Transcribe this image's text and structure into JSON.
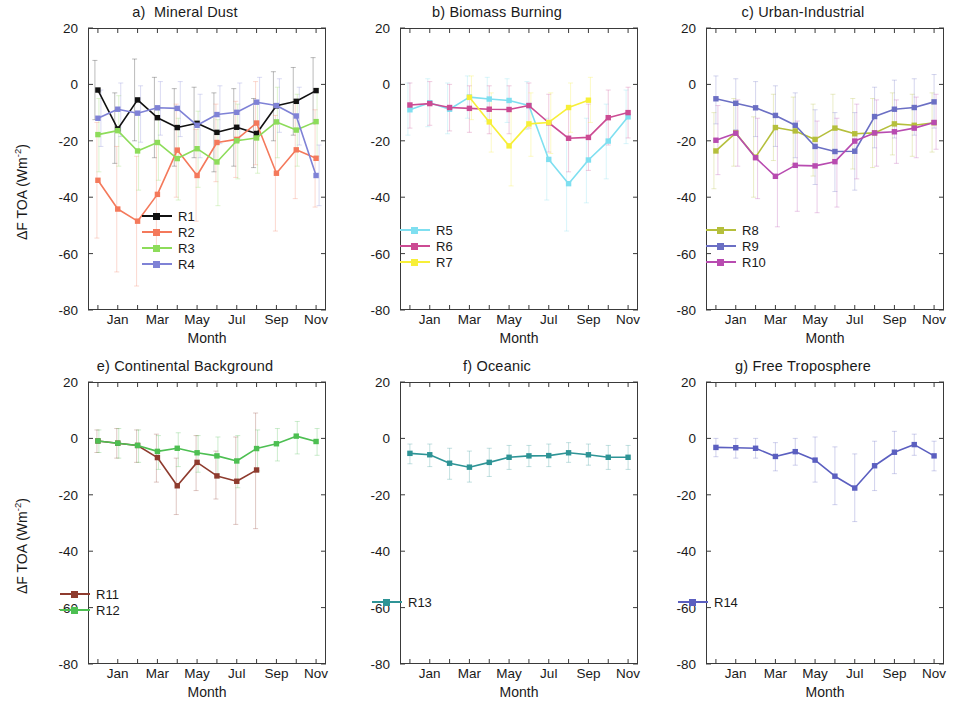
{
  "figure": {
    "axis_y_title_html": "ΔF TOA (Wm<sup>-2</sup>)",
    "axis_x_title": "Month",
    "y_ticks": [
      "20",
      "0",
      "-20",
      "-40",
      "-60",
      "-80"
    ],
    "x_ticks": [
      "Jan",
      "Mar",
      "May",
      "Jul",
      "Sep",
      "Nov"
    ]
  },
  "chart_data": [
    {
      "type": "line",
      "panel_id": "a",
      "title": "a)  Mineral Dust",
      "xlabel": "Month",
      "ylabel": "ΔF TOA (Wm-2)",
      "ylim": [
        -80,
        20
      ],
      "yticks": [
        20,
        0,
        -20,
        -40,
        -60,
        -80
      ],
      "x": [
        "Dec",
        "Jan",
        "Feb",
        "Mar",
        "Apr",
        "May",
        "Jun",
        "Jul",
        "Aug",
        "Sep",
        "Oct",
        "Nov"
      ],
      "xtick_labels": [
        "Jan",
        "Mar",
        "May",
        "Jul",
        "Sep",
        "Nov"
      ],
      "grid": false,
      "legend_position": "lower-center",
      "errorbars": true,
      "series": [
        {
          "name": "R1",
          "color": "#111111",
          "values": [
            -2.0,
            -15.8,
            -5.5,
            -11.8,
            -15.3,
            -13.8,
            -17.0,
            -15.2,
            -17.4,
            -7.6,
            -6.0,
            -2.2
          ],
          "err_low": [
            -12.5,
            -28.0,
            -20.0,
            -26.0,
            -29.0,
            -26.0,
            -31.0,
            -29.0,
            -29.5,
            -20.0,
            -18.0,
            -14.0
          ],
          "err_high": [
            8.5,
            -3.0,
            9.0,
            2.5,
            -1.5,
            -1.0,
            -3.0,
            -1.5,
            -5.0,
            4.5,
            6.0,
            9.5
          ]
        },
        {
          "name": "R2",
          "color": "#f4795b",
          "values": [
            -34.0,
            -44.2,
            -48.5,
            -39.0,
            -23.3,
            -32.3,
            -20.6,
            -19.5,
            -13.7,
            -31.5,
            -23.2,
            -26.2
          ],
          "err_low": [
            -54.5,
            -66.5,
            -71.5,
            -58.0,
            -40.0,
            -48.5,
            -34.5,
            -33.0,
            -28.5,
            -52.0,
            -40.5,
            -43.5
          ],
          "err_high": [
            -13.5,
            -22.0,
            -25.5,
            -20.0,
            -7.0,
            -16.0,
            -7.0,
            -6.0,
            1.0,
            -11.0,
            -6.0,
            -9.0
          ]
        },
        {
          "name": "R3",
          "color": "#8ddc5a",
          "values": [
            -17.8,
            -16.4,
            -23.6,
            -20.6,
            -26.3,
            -22.8,
            -27.5,
            -20.0,
            -19.0,
            -13.3,
            -16.2,
            -13.2
          ],
          "err_low": [
            -31.0,
            -29.0,
            -37.5,
            -34.0,
            -41.0,
            -36.5,
            -43.0,
            -33.5,
            -31.5,
            -26.0,
            -29.0,
            -25.5
          ],
          "err_high": [
            -5.0,
            -4.0,
            -10.0,
            -8.0,
            -12.0,
            -9.5,
            -12.5,
            -7.0,
            -6.5,
            -1.0,
            -3.5,
            -1.5
          ]
        },
        {
          "name": "R4",
          "color": "#7f82d6",
          "values": [
            -12.0,
            -8.8,
            -10.2,
            -8.3,
            -8.5,
            -14.5,
            -10.7,
            -9.9,
            -6.3,
            -7.5,
            -11.2,
            -32.3
          ],
          "err_low": [
            -22.0,
            -18.5,
            -20.5,
            -18.0,
            -18.5,
            -26.0,
            -21.0,
            -19.5,
            -15.5,
            -17.0,
            -21.5,
            -43.0
          ],
          "err_high": [
            -2.0,
            0.5,
            -0.5,
            1.0,
            1.0,
            -3.5,
            -0.5,
            0.5,
            2.5,
            2.0,
            -1.0,
            -21.5
          ]
        }
      ]
    },
    {
      "type": "line",
      "panel_id": "b",
      "title": "b) Biomass Burning",
      "xlabel": "Month",
      "ylabel": "ΔF TOA (Wm-2)",
      "ylim": [
        -80,
        20
      ],
      "yticks": [
        20,
        0,
        -20,
        -40,
        -60,
        -80
      ],
      "x": [
        "Dec",
        "Jan",
        "Feb",
        "Mar",
        "Apr",
        "May",
        "Jun",
        "Jul",
        "Aug",
        "Sep",
        "Oct",
        "Nov"
      ],
      "xtick_labels": [
        "Jan",
        "Mar",
        "May",
        "Jul",
        "Sep",
        "Nov"
      ],
      "grid": false,
      "legend_position": "lower-left",
      "errorbars": true,
      "series": [
        {
          "name": "R5",
          "color": "#7fdff0",
          "values": [
            -9.0,
            -6.5,
            -8.8,
            -4.5,
            -5.2,
            -5.7,
            -7.5,
            -26.6,
            -35.2,
            -26.8,
            -20.1,
            -11.5
          ],
          "err_low": [
            -18.0,
            -15.0,
            -17.5,
            -12.0,
            -13.0,
            -13.5,
            -16.0,
            -41.0,
            -52.0,
            -42.0,
            -33.5,
            -21.0
          ],
          "err_high": [
            0.5,
            2.0,
            0.5,
            3.0,
            2.5,
            2.0,
            1.0,
            -12.0,
            -18.5,
            -12.0,
            -7.0,
            -2.0
          ]
        },
        {
          "name": "R6",
          "color": "#cc4b93",
          "values": [
            -7.3,
            -6.8,
            -8.2,
            -8.5,
            -8.8,
            -8.9,
            -7.5,
            -13.6,
            -19.1,
            -18.8,
            -11.8,
            -10.0
          ],
          "err_low": [
            -15.5,
            -14.5,
            -16.5,
            -17.0,
            -17.5,
            -17.5,
            -15.5,
            -24.0,
            -31.0,
            -30.5,
            -21.5,
            -19.0
          ],
          "err_high": [
            0.5,
            1.0,
            0.0,
            -0.5,
            -0.5,
            -0.5,
            0.5,
            -3.5,
            -7.5,
            -7.0,
            -2.0,
            -1.0
          ]
        },
        {
          "name": "R7",
          "color": "#f7ef38",
          "values": [
            null,
            null,
            null,
            -4.6,
            -13.3,
            -21.8,
            -14.0,
            -13.5,
            -8.2,
            -5.6,
            null,
            null
          ],
          "err_low": [
            null,
            null,
            null,
            -12.5,
            -24.0,
            -36.0,
            -25.5,
            -24.5,
            -17.0,
            -13.5,
            null,
            null
          ],
          "err_high": [
            null,
            null,
            null,
            3.0,
            -3.0,
            -8.5,
            -3.0,
            -3.0,
            0.5,
            2.5,
            null,
            null
          ]
        }
      ]
    },
    {
      "type": "line",
      "panel_id": "c",
      "title": "c) Urban-Industrial",
      "xlabel": "Month",
      "ylabel": "ΔF TOA (Wm-2)",
      "ylim": [
        -80,
        20
      ],
      "yticks": [
        20,
        0,
        -20,
        -40,
        -60,
        -80
      ],
      "x": [
        "Dec",
        "Jan",
        "Feb",
        "Mar",
        "Apr",
        "May",
        "Jun",
        "Jul",
        "Aug",
        "Sep",
        "Oct",
        "Nov"
      ],
      "xtick_labels": [
        "Jan",
        "Mar",
        "May",
        "Jul",
        "Sep",
        "Nov"
      ],
      "grid": false,
      "legend_position": "lower-left",
      "errorbars": true,
      "series": [
        {
          "name": "R8",
          "color": "#b5bf3c",
          "values": [
            -23.6,
            -17.2,
            -25.8,
            -15.3,
            -16.5,
            -19.5,
            -15.5,
            -17.5,
            -17.2,
            -14.0,
            -14.5,
            -13.6
          ],
          "err_low": [
            -37.0,
            -29.0,
            -40.0,
            -27.0,
            -28.5,
            -32.5,
            -27.5,
            -30.0,
            -29.5,
            -25.0,
            -25.5,
            -24.0
          ],
          "err_high": [
            -10.0,
            -5.0,
            -11.5,
            -3.5,
            -4.5,
            -7.0,
            -3.5,
            -5.0,
            -5.0,
            -3.0,
            -3.5,
            -3.0
          ]
        },
        {
          "name": "R9",
          "color": "#6b6fc4",
          "values": [
            -5.1,
            -6.7,
            -8.3,
            -11.0,
            -14.5,
            -22.0,
            -23.8,
            -23.7,
            -11.4,
            -8.8,
            -8.2,
            -6.2
          ],
          "err_low": [
            -14.0,
            -16.0,
            -18.5,
            -22.0,
            -26.0,
            -35.5,
            -38.0,
            -37.5,
            -22.5,
            -19.0,
            -18.0,
            -15.5
          ],
          "err_high": [
            3.0,
            2.0,
            1.0,
            -0.5,
            -3.0,
            -9.0,
            -10.0,
            -10.0,
            -1.0,
            1.5,
            2.0,
            3.5
          ]
        },
        {
          "name": "R10",
          "color": "#b84bb0",
          "values": [
            -19.8,
            -17.3,
            -26.0,
            -32.6,
            -28.7,
            -28.9,
            -27.4,
            -20.1,
            -17.2,
            -16.8,
            -15.5,
            -13.5
          ],
          "err_low": [
            -32.0,
            -29.0,
            -40.5,
            -50.5,
            -45.0,
            -45.5,
            -43.5,
            -33.5,
            -29.0,
            -28.0,
            -26.0,
            -23.0
          ],
          "err_high": [
            -7.5,
            -5.5,
            -12.0,
            -15.5,
            -13.0,
            -13.0,
            -12.0,
            -7.0,
            -5.5,
            -5.5,
            -4.5,
            -3.5
          ]
        }
      ]
    },
    {
      "type": "line",
      "panel_id": "e",
      "title": "e) Continental Background",
      "xlabel": "Month",
      "ylabel": "ΔF TOA (Wm-2)",
      "ylim": [
        -80,
        20
      ],
      "yticks": [
        20,
        0,
        -20,
        -40,
        -60,
        -80
      ],
      "x": [
        "Dec",
        "Jan",
        "Feb",
        "Mar",
        "Apr",
        "May",
        "Jun",
        "Jul",
        "Aug",
        "Sep",
        "Oct",
        "Nov"
      ],
      "xtick_labels": [
        "Jan",
        "Mar",
        "May",
        "Jul",
        "Sep",
        "Nov"
      ],
      "grid": false,
      "legend_position": "lower-left",
      "errorbars": true,
      "series": [
        {
          "name": "R11",
          "color": "#8e3b2e",
          "values": [
            -0.9,
            -1.7,
            -2.5,
            -6.8,
            -16.8,
            -8.5,
            -13.3,
            -15.2,
            -11.2,
            null,
            null,
            null
          ],
          "err_low": [
            -5.0,
            -7.0,
            -8.5,
            -15.5,
            -27.0,
            -18.5,
            -21.5,
            -30.5,
            -32.0,
            null,
            null,
            null
          ],
          "err_high": [
            3.0,
            3.5,
            3.0,
            1.5,
            -7.0,
            1.0,
            -4.5,
            0.5,
            9.0,
            null,
            null,
            null
          ]
        },
        {
          "name": "R12",
          "color": "#4dbf52",
          "values": [
            -0.9,
            -1.7,
            -2.5,
            -4.6,
            -3.5,
            -5.1,
            -6.2,
            -8.0,
            -3.6,
            -1.9,
            0.8,
            -1.1
          ],
          "err_low": [
            -5.0,
            -7.0,
            -8.5,
            -11.0,
            -10.0,
            -12.0,
            -14.0,
            -17.5,
            -11.5,
            -8.0,
            -5.5,
            -6.0
          ],
          "err_high": [
            3.0,
            3.5,
            3.0,
            1.0,
            2.0,
            1.0,
            0.5,
            1.0,
            3.0,
            3.5,
            6.0,
            3.5
          ]
        }
      ]
    },
    {
      "type": "line",
      "panel_id": "f",
      "title": "f) Oceanic",
      "xlabel": "Month",
      "ylabel": "ΔF TOA (Wm-2)",
      "ylim": [
        -80,
        20
      ],
      "yticks": [
        20,
        0,
        -20,
        -40,
        -60,
        -80
      ],
      "x": [
        "Dec",
        "Jan",
        "Feb",
        "Mar",
        "Apr",
        "May",
        "Jun",
        "Jul",
        "Aug",
        "Sep",
        "Oct",
        "Nov"
      ],
      "xtick_labels": [
        "Jan",
        "Mar",
        "May",
        "Jul",
        "Sep",
        "Nov"
      ],
      "grid": false,
      "legend_position": "lower-left",
      "errorbars": true,
      "series": [
        {
          "name": "R13",
          "color": "#2e9496",
          "values": [
            -5.3,
            -5.8,
            -8.8,
            -10.2,
            -8.5,
            -6.7,
            -6.2,
            -6.1,
            -5.1,
            -5.8,
            -6.7,
            -6.7
          ],
          "err_low": [
            -9.0,
            -10.0,
            -14.5,
            -15.5,
            -13.5,
            -11.0,
            -10.0,
            -10.0,
            -8.5,
            -9.5,
            -11.0,
            -11.0
          ],
          "err_high": [
            -2.0,
            -2.0,
            -3.5,
            -4.5,
            -3.5,
            -2.5,
            -2.5,
            -2.0,
            -1.5,
            -2.0,
            -2.5,
            -2.5
          ]
        }
      ]
    },
    {
      "type": "line",
      "panel_id": "g",
      "title": "g) Free Troposphere",
      "xlabel": "Month",
      "ylabel": "ΔF TOA (Wm-2)",
      "ylim": [
        -80,
        20
      ],
      "yticks": [
        20,
        0,
        -20,
        -40,
        -60,
        -80
      ],
      "x": [
        "Dec",
        "Jan",
        "Feb",
        "Mar",
        "Apr",
        "May",
        "Jun",
        "Jul",
        "Aug",
        "Sep",
        "Oct",
        "Nov"
      ],
      "xtick_labels": [
        "Jan",
        "Mar",
        "May",
        "Jul",
        "Sep",
        "Nov"
      ],
      "grid": false,
      "legend_position": "lower-left",
      "errorbars": true,
      "series": [
        {
          "name": "R14",
          "color": "#5b5fc0",
          "values": [
            -3.2,
            -3.3,
            -3.5,
            -6.4,
            -4.7,
            -7.7,
            -13.4,
            -17.6,
            -9.7,
            -4.9,
            -2.2,
            -6.2
          ],
          "err_low": [
            -6.5,
            -7.0,
            -7.0,
            -11.5,
            -9.5,
            -15.5,
            -23.5,
            -29.5,
            -18.5,
            -12.5,
            -6.0,
            -11.5
          ],
          "err_high": [
            0.0,
            0.0,
            0.0,
            -1.5,
            0.0,
            0.5,
            -3.0,
            -5.5,
            -1.0,
            2.5,
            1.5,
            -1.0
          ]
        }
      ]
    }
  ],
  "layout": {
    "panel_positions": [
      {
        "panel_id": "a",
        "left": 30,
        "top": 0,
        "show_ylabel": true
      },
      {
        "panel_id": "b",
        "left": 342,
        "top": 0,
        "show_ylabel": false
      },
      {
        "panel_id": "c",
        "left": 648,
        "top": 0,
        "show_ylabel": false
      },
      {
        "panel_id": "e",
        "left": 30,
        "top": 354,
        "show_ylabel": true
      },
      {
        "panel_id": "f",
        "left": 342,
        "top": 354,
        "show_ylabel": false
      },
      {
        "panel_id": "g",
        "left": 648,
        "top": 354,
        "show_ylabel": false
      }
    ],
    "legend_offsets": {
      "a": {
        "left": 112,
        "top": 208
      },
      "b": {
        "left": 58,
        "top": 222
      },
      "c": {
        "left": 58,
        "top": 222
      },
      "e": {
        "left": 30,
        "top": 232
      },
      "f": {
        "left": 30,
        "top": 240
      },
      "g": {
        "left": 30,
        "top": 240
      }
    }
  }
}
